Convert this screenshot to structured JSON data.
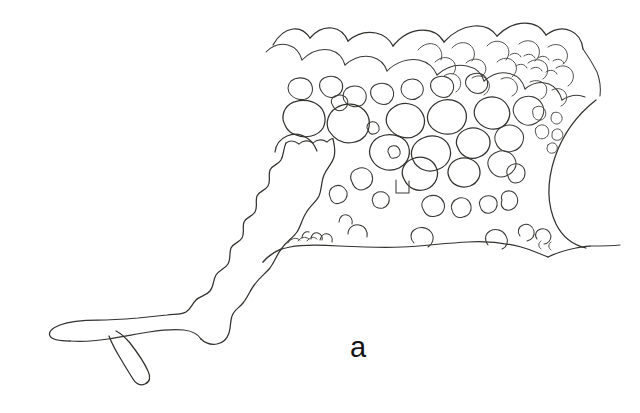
{
  "figure": {
    "kind": "scientific-line-drawing",
    "panel_label": "a",
    "background_color": "#ffffff",
    "ink_color": "#33322f",
    "canvas": {
      "width": 640,
      "height": 413
    }
  },
  "parts": [
    {
      "id": "appendage",
      "name": "tapering appendage",
      "label": ""
    },
    {
      "id": "appendage-tip",
      "name": "rounded distal tip",
      "label": ""
    },
    {
      "id": "appendage-spur",
      "name": "small finger-like spur",
      "label": ""
    },
    {
      "id": "body-mass",
      "name": "main tuberculate body mass",
      "label": ""
    },
    {
      "id": "crest",
      "name": "scalloped upper crest",
      "label": ""
    },
    {
      "id": "right-arc",
      "name": "large concave arc at right margin",
      "label": ""
    },
    {
      "id": "tubercle-field",
      "name": "field of rounded tubercles",
      "label": ""
    }
  ],
  "drawing": {
    "appendage_outline": "M 49 333 C 41 327, 44 318, 56 316 C 74 313, 96 312, 118 311 C 141 310, 163 309, 181 306 C 196 303, 204 297, 210 288 C 216 278, 219 269, 226 259 C 233 249, 238 244, 239 236 C 240 228, 236 223, 238 215 C 240 207, 247 204, 248 197 C 249 190, 244 186, 247 179 C 250 172, 258 171, 260 164 C 262 157, 257 152, 261 146 C 265 140, 273 141, 277 136 C 281 131, 279 125, 283 121 C 287 117, 294 117, 298 113 C 302 109, 301 104, 305 101 C 309 98, 315 99, 319 97",
    "appendage_lower": "M 319 97 C 321 104, 320 112, 317 120 C 313 132, 307 141, 303 151 C 299 161, 298 168, 293 178 C 288 188, 282 193, 277 202 C 272 211, 271 218, 266 227 C 261 236, 256 240, 251 248 C 246 256, 244 262, 239 270 C 234 278, 229 281, 226 288 C 224 294, 226 302, 224 309 C 223 315, 219 320, 215 324 C 211 328, 206 329, 203 326 C 200 323, 201 317, 200 312 C 199 307, 196 303, 191 302 C 183 301, 172 305, 160 309 C 147 313, 133 317, 121 319 C 109 321, 98 321, 88 321",
    "appendage_tip_curve": "M 88 321 C 74 321, 62 324, 55 328 C 50 331, 49 333, 49 333",
    "appendage_spur": "M 92 329 C 100 337, 108 346, 114 355 C 119 362, 122 368, 126 372 C 130 375, 135 375, 138 372 C 141 369, 140 364, 137 358 C 132 349, 124 339, 117 331 C 111 325, 106 322, 102 322",
    "body_bottom": "M 215 324 C 222 319, 228 311, 233 302 C 238 293, 241 285, 246 278 C 251 271, 257 268, 263 262",
    "right_arc": "M 588 103 C 571 117, 558 136, 551 158 C 544 180, 544 202, 552 220 C 558 234, 568 242, 580 246",
    "right_tail": "M 580 246 C 593 247, 606 247, 617 246"
  },
  "colors": {
    "background": "#ffffff",
    "ink": "#33322f",
    "ink_light": "#494845",
    "label": "#141414"
  }
}
